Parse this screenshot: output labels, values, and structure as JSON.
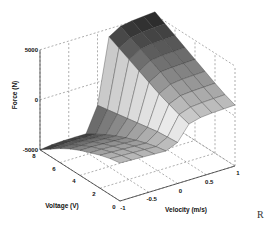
{
  "chart_data": {
    "type": "surface3d",
    "title": "",
    "xlabel": "Velocity (m/s)",
    "ylabel": "Voltage (V)",
    "zlabel": "Force (N)",
    "x_ticks": [
      "-1",
      "-0.5",
      "0",
      "0.5",
      "1"
    ],
    "y_ticks": [
      "0",
      "2",
      "4",
      "6",
      "8"
    ],
    "z_ticks": [
      "-5000",
      "0",
      "5000"
    ],
    "xlim": [
      -1,
      1
    ],
    "ylim": [
      0,
      8
    ],
    "zlim": [
      -5000,
      5000
    ],
    "grid": true,
    "colormap": "gray",
    "velocity": [
      -1,
      -0.8,
      -0.6,
      -0.4,
      -0.2,
      0,
      0.2,
      0.4,
      0.6,
      0.8,
      1
    ],
    "voltage": [
      0,
      1,
      2,
      3,
      4,
      5,
      6,
      7,
      8
    ],
    "force": [
      [
        -1200,
        -1250,
        -1300,
        -1350,
        -1400,
        -900,
        600,
        900,
        1000,
        1050,
        1100
      ],
      [
        -1400,
        -1450,
        -1500,
        -1550,
        -1600,
        -1000,
        900,
        1300,
        1400,
        1450,
        1500
      ],
      [
        -1700,
        -1750,
        -1800,
        -1850,
        -1900,
        -1100,
        1300,
        1800,
        1900,
        1950,
        2000
      ],
      [
        -2100,
        -2100,
        -2150,
        -2200,
        -2250,
        -1300,
        1700,
        2300,
        2450,
        2500,
        2550
      ],
      [
        -2500,
        -2500,
        -2550,
        -2600,
        -2650,
        -1500,
        2200,
        2900,
        3000,
        3050,
        3100
      ],
      [
        -3000,
        -3000,
        -3000,
        -3050,
        -3100,
        -1700,
        2700,
        3400,
        3550,
        3600,
        3650
      ],
      [
        -3600,
        -3550,
        -3550,
        -3600,
        -3600,
        -1900,
        3200,
        3900,
        4100,
        4150,
        4200
      ],
      [
        -4300,
        -4200,
        -4150,
        -4200,
        -4200,
        -2100,
        3700,
        4400,
        4600,
        4700,
        4750
      ],
      [
        -5000,
        -4850,
        -4800,
        -4800,
        -4800,
        -2300,
        4200,
        4900,
        5100,
        5200,
        5300
      ]
    ]
  },
  "corner_mark": "R"
}
